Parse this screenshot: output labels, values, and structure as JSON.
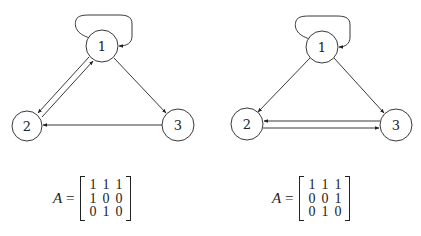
{
  "graphs": [
    {
      "id": "left",
      "nodes": [
        {
          "label": "1",
          "cx": 102,
          "cy": 46,
          "r": 16
        },
        {
          "label": "2",
          "cx": 27,
          "cy": 126,
          "r": 15
        },
        {
          "label": "3",
          "cx": 178,
          "cy": 125,
          "r": 16
        }
      ],
      "edges": [
        {
          "from": "1",
          "to": "1",
          "type": "self-loop"
        },
        {
          "from": "1",
          "to": "2"
        },
        {
          "from": "2",
          "to": "1"
        },
        {
          "from": "1",
          "to": "3"
        },
        {
          "from": "3",
          "to": "2"
        }
      ],
      "matrix": {
        "lhs_var": "A",
        "lhs_eq": "=",
        "rows": [
          [
            "1",
            "1",
            "1"
          ],
          [
            "1",
            "0",
            "0"
          ],
          [
            "0",
            "1",
            "0"
          ]
        ]
      }
    },
    {
      "id": "right",
      "nodes": [
        {
          "label": "1",
          "cx": 322,
          "cy": 47,
          "r": 16
        },
        {
          "label": "2",
          "cx": 247,
          "cy": 124,
          "r": 16
        },
        {
          "label": "3",
          "cx": 396,
          "cy": 125,
          "r": 16
        }
      ],
      "edges": [
        {
          "from": "1",
          "to": "1",
          "type": "self-loop"
        },
        {
          "from": "1",
          "to": "2"
        },
        {
          "from": "1",
          "to": "3"
        },
        {
          "from": "3",
          "to": "2"
        },
        {
          "from": "2",
          "to": "3"
        }
      ],
      "matrix": {
        "lhs_var": "A",
        "lhs_eq": "=",
        "rows": [
          [
            "1",
            "1",
            "1"
          ],
          [
            "0",
            "0",
            "1"
          ],
          [
            "0",
            "1",
            "0"
          ]
        ]
      }
    }
  ],
  "colors": {
    "stroke": "#222222",
    "background": "#ffffff"
  }
}
